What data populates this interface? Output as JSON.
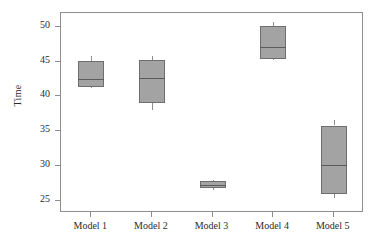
{
  "chart_data": {
    "type": "box",
    "title": "",
    "xlabel": "",
    "ylabel": "Time",
    "categories": [
      "Model 1",
      "Model 2",
      "Model 3",
      "Model 4",
      "Model 5"
    ],
    "ylim": [
      23.2,
      52.0
    ],
    "yticks": [
      25,
      30,
      35,
      40,
      45,
      50
    ],
    "ytick_labels": [
      "25",
      "30",
      "35",
      "40",
      "45",
      "50"
    ],
    "grid": false,
    "legend": "none",
    "box_fill_color": "#a3a3a3",
    "box_edge_color": "#6e6e6e",
    "axis_color": "#8d8d8d",
    "text_color": "#2b2b2b",
    "boxes": [
      {
        "label": "Model 1",
        "whisker_low": 41.2,
        "q1": 41.3,
        "median": 42.5,
        "q3": 45.1,
        "whisker_high": 45.8
      },
      {
        "label": "Model 2",
        "whisker_low": 38.0,
        "q1": 39.1,
        "median": 42.6,
        "q3": 45.2,
        "whisker_high": 45.8
      },
      {
        "label": "Model 3",
        "whisker_low": 26.5,
        "q1": 26.8,
        "median": 27.2,
        "q3": 27.8,
        "whisker_high": 27.9
      },
      {
        "label": "Model 4",
        "whisker_low": 45.2,
        "q1": 45.4,
        "median": 47.1,
        "q3": 50.1,
        "whisker_high": 50.7
      },
      {
        "label": "Model 5",
        "whisker_low": 25.3,
        "q1": 25.9,
        "median": 30.1,
        "q3": 35.8,
        "whisker_high": 36.6
      }
    ]
  }
}
